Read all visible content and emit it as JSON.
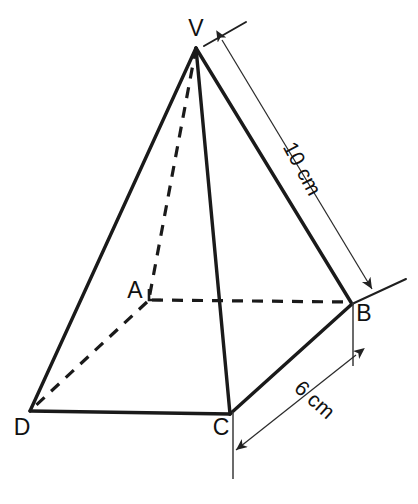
{
  "figure": {
    "shape": "square-based pyramid",
    "background_color": "#ffffff",
    "line_color": "#1a1a1a"
  },
  "vertices": [
    {
      "name": "V",
      "label": "V",
      "role": "apex",
      "x": 196,
      "y": 48,
      "label_x": 196,
      "label_y": 36,
      "visible": true
    },
    {
      "name": "A",
      "label": "A",
      "role": "base-back-left",
      "x": 149,
      "y": 299,
      "label_x": 135,
      "label_y": 298,
      "visible": true
    },
    {
      "name": "B",
      "label": "B",
      "role": "base-back-right",
      "x": 352,
      "y": 304,
      "label_x": 364,
      "label_y": 321,
      "visible": true
    },
    {
      "name": "C",
      "label": "C",
      "role": "base-front-right",
      "x": 230,
      "y": 414,
      "label_x": 221,
      "label_y": 435,
      "visible": true
    },
    {
      "name": "D",
      "label": "D",
      "role": "base-front-left",
      "x": 30,
      "y": 411,
      "label_x": 22,
      "label_y": 435,
      "visible": true
    }
  ],
  "edges": [
    {
      "name": "V-D",
      "from": "V",
      "to": "D",
      "style": "solid"
    },
    {
      "name": "V-C",
      "from": "V",
      "to": "C",
      "style": "solid"
    },
    {
      "name": "V-B",
      "from": "V",
      "to": "B",
      "style": "solid"
    },
    {
      "name": "V-A",
      "from": "V",
      "to": "A",
      "style": "dashed"
    },
    {
      "name": "A-B",
      "from": "A",
      "to": "B",
      "style": "dashed"
    },
    {
      "name": "A-D",
      "from": "A",
      "to": "D",
      "style": "dashed"
    },
    {
      "name": "D-C",
      "from": "D",
      "to": "C",
      "style": "solid"
    },
    {
      "name": "C-B",
      "from": "C",
      "to": "B",
      "style": "solid"
    }
  ],
  "dimensions": [
    {
      "name": "slant-edge-vb",
      "label": "10 cm",
      "measures": "V-B",
      "label_x": 296,
      "label_y": 172,
      "label_rotation": 62,
      "dim_start_x": 222,
      "dim_start_y": 40,
      "dim_end_x": 372,
      "dim_end_y": 289,
      "ext1_start_x": 204,
      "ext1_start_y": 46,
      "ext1_end_x": 246,
      "ext1_end_y": 22,
      "ext2_start_x": 352,
      "ext2_start_y": 304,
      "ext2_end_x": 406,
      "ext2_end_y": 279
    },
    {
      "name": "base-edge-cb",
      "label": "6 cm",
      "measures": "C-B",
      "label_x": 310,
      "label_y": 405,
      "label_rotation": 42,
      "dim_start_x": 356,
      "dim_start_y": 355,
      "dim_end_x": 236,
      "dim_end_y": 450,
      "ext1_start_x": 353,
      "ext1_start_y": 302,
      "ext1_end_x": 353,
      "ext1_end_y": 366,
      "ext2_start_x": 233,
      "ext2_start_y": 412,
      "ext2_end_x": 233,
      "ext2_end_y": 479
    }
  ],
  "markers": [
    {
      "name": "right-angle-at-a",
      "at": "A",
      "type": "right-angle-tick"
    }
  ]
}
